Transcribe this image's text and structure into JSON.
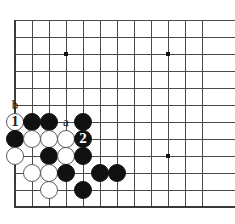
{
  "diagram": {
    "kind": "go-board-diagram",
    "board_size": 19,
    "visible_columns": 12,
    "visible_rows": 11,
    "colors": {
      "background": "#ffffff",
      "grid_line": "#4a4a4a",
      "border_line": "#3a3a3a",
      "black_stone": "#111111",
      "white_stone": "#ffffff",
      "white_stone_edge": "#5a5a5a",
      "star_point": "#111111",
      "label_text": "#111111"
    },
    "geometry": {
      "origin_x": 15,
      "origin_y": 20,
      "cell": 17,
      "stone_radius": 9.2,
      "edge_left_x": 15,
      "edge_top_y": 20,
      "edge_bottom_y": 207
    },
    "star_points": [
      {
        "col": 3,
        "row": 2
      },
      {
        "col": 9,
        "row": 2
      },
      {
        "col": 9,
        "row": 8
      }
    ],
    "stones": [
      {
        "color": "white",
        "col": 0,
        "row": 6,
        "label": "1",
        "label_name": "stone-label-1"
      },
      {
        "color": "black",
        "col": 1,
        "row": 6,
        "label": "",
        "label_name": ""
      },
      {
        "color": "black",
        "col": 2,
        "row": 6,
        "label": "",
        "label_name": ""
      },
      {
        "color": "black",
        "col": 4,
        "row": 6,
        "label": "",
        "label_name": ""
      },
      {
        "color": "black",
        "col": 0,
        "row": 7,
        "label": "",
        "label_name": ""
      },
      {
        "color": "white",
        "col": 1,
        "row": 7,
        "label": "",
        "label_name": ""
      },
      {
        "color": "white",
        "col": 2,
        "row": 7,
        "label": "",
        "label_name": ""
      },
      {
        "color": "white",
        "col": 3,
        "row": 7,
        "label": "",
        "label_name": ""
      },
      {
        "color": "black",
        "col": 4,
        "row": 7,
        "label": "2",
        "label_name": "stone-label-2"
      },
      {
        "color": "white",
        "col": 0,
        "row": 8,
        "label": "",
        "label_name": ""
      },
      {
        "color": "black",
        "col": 2,
        "row": 8,
        "label": "",
        "label_name": ""
      },
      {
        "color": "white",
        "col": 3,
        "row": 8,
        "label": "",
        "label_name": ""
      },
      {
        "color": "black",
        "col": 4,
        "row": 8,
        "label": "",
        "label_name": ""
      },
      {
        "color": "white",
        "col": 1,
        "row": 9,
        "label": "",
        "label_name": ""
      },
      {
        "color": "white",
        "col": 2,
        "row": 9,
        "label": "",
        "label_name": ""
      },
      {
        "color": "black",
        "col": 3,
        "row": 9,
        "label": "",
        "label_name": ""
      },
      {
        "color": "black",
        "col": 5,
        "row": 9,
        "label": "",
        "label_name": ""
      },
      {
        "color": "black",
        "col": 6,
        "row": 9,
        "label": "",
        "label_name": ""
      },
      {
        "color": "white",
        "col": 2,
        "row": 10,
        "label": "",
        "label_name": ""
      },
      {
        "color": "black",
        "col": 4,
        "row": 10,
        "label": "",
        "label_name": ""
      }
    ],
    "point_labels": [
      {
        "text": "b",
        "col": 0,
        "row": 5,
        "name": "point-label-b"
      },
      {
        "text": "a",
        "col": 3,
        "row": 6,
        "name": "point-label-a"
      }
    ]
  }
}
